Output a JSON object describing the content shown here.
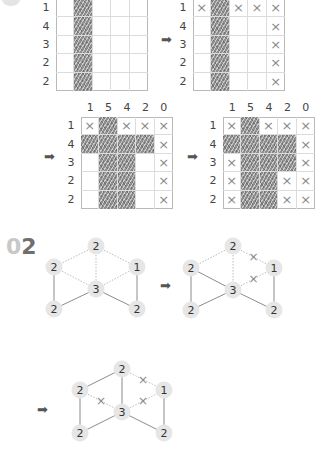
{
  "section_01": {
    "step_grids": [
      {
        "id": "grid-a",
        "col_clues": [],
        "row_clues": [
          "1",
          "4",
          "3",
          "2",
          "2"
        ],
        "cells": [
          [
            ".",
            "F",
            ".",
            ".",
            "."
          ],
          [
            ".",
            "F",
            ".",
            ".",
            "."
          ],
          [
            ".",
            "F",
            ".",
            ".",
            "."
          ],
          [
            ".",
            "F",
            ".",
            ".",
            "."
          ],
          [
            ".",
            "F",
            ".",
            ".",
            "."
          ]
        ]
      },
      {
        "id": "grid-b",
        "col_clues": [],
        "row_clues": [
          "1",
          "4",
          "3",
          "2",
          "2"
        ],
        "cells": [
          [
            "X",
            "F",
            "X",
            "X",
            "X"
          ],
          [
            ".",
            "F",
            ".",
            ".",
            "X"
          ],
          [
            ".",
            "F",
            ".",
            ".",
            "X"
          ],
          [
            ".",
            "F",
            ".",
            ".",
            "X"
          ],
          [
            ".",
            "F",
            ".",
            ".",
            "X"
          ]
        ]
      },
      {
        "id": "grid-c",
        "col_clues": [
          "1",
          "5",
          "4",
          "2",
          "0"
        ],
        "row_clues": [
          "1",
          "4",
          "3",
          "2",
          "2"
        ],
        "cells": [
          [
            "X",
            "F",
            "X",
            "X",
            "X"
          ],
          [
            "F",
            "F",
            "F",
            "F",
            "X"
          ],
          [
            ".",
            "F",
            "F",
            ".",
            "X"
          ],
          [
            ".",
            "F",
            "F",
            ".",
            "X"
          ],
          [
            ".",
            "F",
            "F",
            ".",
            "X"
          ]
        ]
      },
      {
        "id": "grid-d",
        "col_clues": [
          "1",
          "5",
          "4",
          "2",
          "0"
        ],
        "row_clues": [
          "1",
          "4",
          "3",
          "2",
          "2"
        ],
        "cells": [
          [
            "X",
            "F",
            "X",
            "X",
            "X"
          ],
          [
            "F",
            "F",
            "F",
            "F",
            "X"
          ],
          [
            "X",
            "F",
            "F",
            "F",
            "X"
          ],
          [
            "X",
            "F",
            "F",
            "X",
            "X"
          ],
          [
            "X",
            "F",
            "F",
            "X",
            "X"
          ]
        ]
      }
    ],
    "arrow_glyph": "➡",
    "x_glyph": "×"
  },
  "section_02": {
    "number_prefix": "0",
    "number_main": "2",
    "graphs": [
      {
        "id": "graph-1",
        "nodes": [
          {
            "id": "top",
            "label": "2"
          },
          {
            "id": "left",
            "label": "2"
          },
          {
            "id": "right",
            "label": "1"
          },
          {
            "id": "center",
            "label": "3"
          },
          {
            "id": "bottom-left",
            "label": "2"
          },
          {
            "id": "bottom-right",
            "label": "2"
          }
        ],
        "edges": [
          {
            "from": "top",
            "to": "left",
            "style": "dotted",
            "crossed": false
          },
          {
            "from": "top",
            "to": "center",
            "style": "dotted",
            "crossed": false
          },
          {
            "from": "top",
            "to": "right",
            "style": "dotted",
            "crossed": false
          },
          {
            "from": "left",
            "to": "center",
            "style": "dotted",
            "crossed": false
          },
          {
            "from": "center",
            "to": "right",
            "style": "dotted",
            "crossed": false
          },
          {
            "from": "left",
            "to": "bottom-left",
            "style": "solid",
            "crossed": false
          },
          {
            "from": "bottom-left",
            "to": "center",
            "style": "solid",
            "crossed": false
          },
          {
            "from": "center",
            "to": "bottom-right",
            "style": "solid",
            "crossed": false
          },
          {
            "from": "right",
            "to": "bottom-right",
            "style": "solid",
            "crossed": false
          }
        ]
      },
      {
        "id": "graph-2",
        "nodes": [
          {
            "id": "top",
            "label": "2"
          },
          {
            "id": "left",
            "label": "2"
          },
          {
            "id": "right",
            "label": "1"
          },
          {
            "id": "center",
            "label": "3"
          },
          {
            "id": "bottom-left",
            "label": "2"
          },
          {
            "id": "bottom-right",
            "label": "2"
          }
        ],
        "edges": [
          {
            "from": "top",
            "to": "left",
            "style": "dotted",
            "crossed": false
          },
          {
            "from": "top",
            "to": "center",
            "style": "dotted",
            "crossed": false
          },
          {
            "from": "top",
            "to": "right",
            "style": "dotted",
            "crossed": true
          },
          {
            "from": "left",
            "to": "center",
            "style": "solid",
            "crossed": false
          },
          {
            "from": "center",
            "to": "right",
            "style": "dotted",
            "crossed": true
          },
          {
            "from": "left",
            "to": "bottom-left",
            "style": "solid",
            "crossed": false
          },
          {
            "from": "bottom-left",
            "to": "center",
            "style": "solid",
            "crossed": false
          },
          {
            "from": "center",
            "to": "bottom-right",
            "style": "solid",
            "crossed": false
          },
          {
            "from": "right",
            "to": "bottom-right",
            "style": "solid",
            "crossed": false
          }
        ]
      },
      {
        "id": "graph-3",
        "nodes": [
          {
            "id": "top",
            "label": "2"
          },
          {
            "id": "left",
            "label": "2"
          },
          {
            "id": "right",
            "label": "1"
          },
          {
            "id": "center",
            "label": "3"
          },
          {
            "id": "bottom-left",
            "label": "2"
          },
          {
            "id": "bottom-right",
            "label": "2"
          }
        ],
        "edges": [
          {
            "from": "top",
            "to": "left",
            "style": "solid",
            "crossed": false
          },
          {
            "from": "top",
            "to": "center",
            "style": "solid",
            "crossed": false
          },
          {
            "from": "top",
            "to": "right",
            "style": "dotted",
            "crossed": true
          },
          {
            "from": "left",
            "to": "center",
            "style": "dotted",
            "crossed": true
          },
          {
            "from": "center",
            "to": "right",
            "style": "dotted",
            "crossed": true
          },
          {
            "from": "left",
            "to": "bottom-left",
            "style": "solid",
            "crossed": false
          },
          {
            "from": "bottom-left",
            "to": "center",
            "style": "solid",
            "crossed": false
          },
          {
            "from": "center",
            "to": "bottom-right",
            "style": "solid",
            "crossed": false
          },
          {
            "from": "right",
            "to": "bottom-right",
            "style": "solid",
            "crossed": false
          }
        ]
      }
    ]
  },
  "colors": {
    "fill": "#8f8f8f",
    "grid_line": "#dcdcdc",
    "grid_border": "#b9b9b9",
    "cross": "#8a8a8a",
    "node_bg": "#e6e6e6",
    "edge_solid": "#8c8c8c",
    "edge_dotted": "#bdbdbd",
    "section_num_light": "#c8c8c8",
    "section_num_dark": "#6f6f6f"
  }
}
